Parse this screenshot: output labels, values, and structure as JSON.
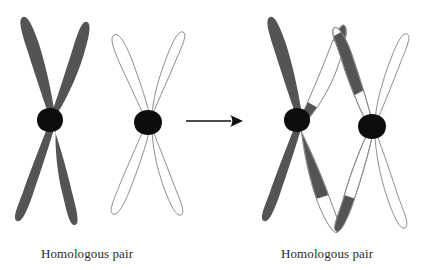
{
  "figure": {
    "type": "biology-diagram"
  },
  "colors": {
    "dark_chromatid": "#545454",
    "centromere": "#0d0d0d",
    "outline": "#8d8d8d",
    "background": "#ffffff",
    "arrow": "#111111",
    "caption_text": "#2b2b2b"
  },
  "panels": {
    "left": {
      "caption": "Homologous pair",
      "chromosomes": [
        {
          "name": "maternal-chromosome",
          "shading": "solid-dark",
          "centromere": true,
          "chromatids": 4
        },
        {
          "name": "paternal-chromosome",
          "shading": "outline-white",
          "centromere": true,
          "chromatids": 4
        }
      ]
    },
    "right": {
      "caption": "Homologous pair",
      "chromosomes": [
        {
          "name": "recombinant-dark-chromosome",
          "shading": "dark-with-white-segments",
          "centromere": true,
          "chromatids": 4
        },
        {
          "name": "recombinant-light-chromosome",
          "shading": "outline-with-dark-segments",
          "centromere": true,
          "chromatids": 4
        }
      ]
    }
  },
  "arrow": {
    "name": "transition-arrow",
    "direction": "right"
  }
}
